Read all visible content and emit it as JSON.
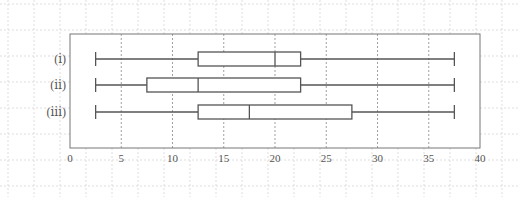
{
  "chart_data": {
    "type": "boxplot",
    "orientation": "horizontal",
    "title": "",
    "xlabel": "",
    "ylabel": "",
    "xlim": [
      0,
      40
    ],
    "x_ticks": [
      0,
      5,
      10,
      15,
      20,
      25,
      30,
      35,
      40
    ],
    "grid": {
      "vertical_dashed": true,
      "background_dotted": true
    },
    "series": [
      {
        "name": "(ⅰ)",
        "min": 2.5,
        "q1": 12.5,
        "median": 20,
        "q3": 22.5,
        "max": 37.5
      },
      {
        "name": "(ⅱ)",
        "min": 2.5,
        "q1": 7.5,
        "median": 12.5,
        "q3": 22.5,
        "max": 37.5
      },
      {
        "name": "(ⅲ)",
        "min": 2.5,
        "q1": 12.5,
        "median": 17.5,
        "q3": 27.5,
        "max": 37.5
      }
    ]
  },
  "colors": {
    "line": "#555555",
    "frame": "#777777",
    "grid": "#888888",
    "background_grid": "#dddddd",
    "text": "#555555"
  }
}
